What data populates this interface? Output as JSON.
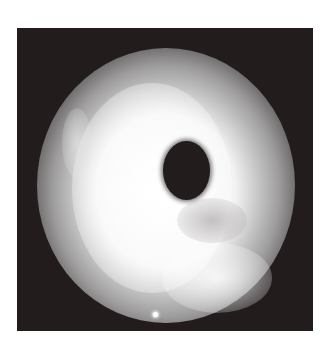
{
  "image": {
    "description": "Grayscale photograph of a bright diffuse cloud-like ring with a dark elliptical hole near the center on a dark square background",
    "colors": {
      "background": "#ffffff",
      "frame": "#221c1d",
      "glow": "#ffffff",
      "hole": "#221c1d"
    }
  }
}
